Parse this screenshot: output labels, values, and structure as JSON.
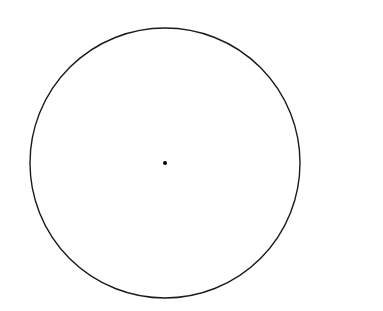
{
  "diagram": {
    "canvas": {
      "width": 383,
      "height": 311,
      "background": "#ffffff"
    },
    "circle": {
      "cx": 165,
      "cy": 163,
      "r": 135,
      "stroke": "#1a1a1a",
      "stroke_width": 1.4,
      "fill": "none"
    },
    "center_point": {
      "cx": 165,
      "cy": 163,
      "r": 2,
      "fill": "#000000"
    }
  }
}
